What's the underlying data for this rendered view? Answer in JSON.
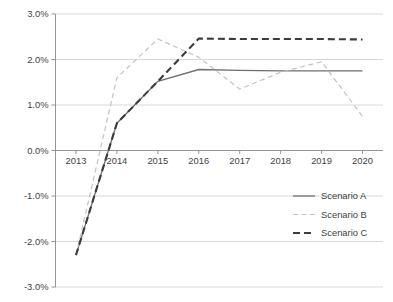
{
  "chart_data": {
    "type": "line",
    "title": "",
    "xlabel": "",
    "ylabel": "",
    "x": [
      2013,
      2014,
      2015,
      2016,
      2017,
      2018,
      2019,
      2020
    ],
    "categories": [
      "2013",
      "2014",
      "2015",
      "2016",
      "2017",
      "2018",
      "2019",
      "2020"
    ],
    "ylim": [
      -3.0,
      3.0
    ],
    "ytick_values": [
      3.0,
      2.0,
      1.0,
      0.0,
      -1.0,
      -2.0,
      -3.0
    ],
    "ytick_labels": [
      "3.0%",
      "2.0%",
      "1.0%",
      "0.0%",
      "-1.0%",
      "-2.0%",
      "-3.0%"
    ],
    "grid": true,
    "grid_axis": "y",
    "legend_position": "lower-right",
    "value_unit": "percent",
    "series": [
      {
        "name": "Scenario A",
        "style": "solid",
        "color": "#6f6f6f",
        "width": 1.3,
        "values": [
          -2.3,
          0.6,
          1.52,
          1.78,
          1.76,
          1.75,
          1.75,
          1.75
        ]
      },
      {
        "name": "Scenario B",
        "style": "dashed",
        "color": "#c2c2c2",
        "width": 1.2,
        "dash": "5,3.5",
        "values": [
          -2.3,
          1.6,
          2.45,
          2.05,
          1.35,
          1.72,
          1.95,
          0.75
        ]
      },
      {
        "name": "Scenario C",
        "style": "dashed",
        "color": "#3c3c3c",
        "width": 2.1,
        "dash": "7,4",
        "values": [
          -2.3,
          0.6,
          1.52,
          2.46,
          2.45,
          2.45,
          2.45,
          2.44
        ]
      }
    ]
  },
  "legend": {
    "items": [
      {
        "label": "Scenario A"
      },
      {
        "label": "Scenario B"
      },
      {
        "label": "Scenario C"
      }
    ]
  }
}
